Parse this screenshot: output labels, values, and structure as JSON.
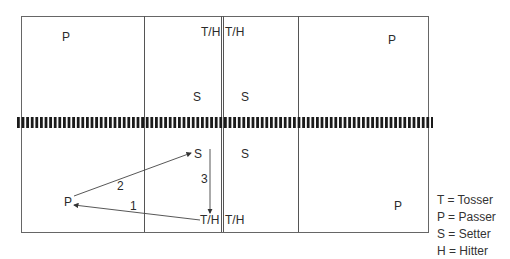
{
  "court": {
    "top_left": {
      "passer": "P"
    },
    "top_mid_left": {
      "tosser_hitter": "T/H",
      "setter": "S"
    },
    "top_mid_right": {
      "tosser_hitter": "T/H",
      "setter": "S"
    },
    "top_right": {
      "passer": "P"
    },
    "bottom_left": {
      "passer": "P"
    },
    "bottom_mid_left": {
      "setter": "S",
      "tosser_hitter": "T/H"
    },
    "bottom_mid_right": {
      "setter": "S",
      "tosser_hitter": "T/H"
    },
    "bottom_right": {
      "passer": "P"
    }
  },
  "arrows": [
    {
      "label": "1",
      "from": "T/H",
      "to": "P"
    },
    {
      "label": "2",
      "from": "P",
      "to": "S"
    },
    {
      "label": "3",
      "from": "S",
      "to": "T/H"
    }
  ],
  "legend": [
    "T = Tosser",
    "P = Passer",
    "S = Setter",
    "H = Hitter"
  ],
  "colors": {
    "line": "#555555",
    "net": "#1a1a1a",
    "text": "#2b2b2b"
  }
}
